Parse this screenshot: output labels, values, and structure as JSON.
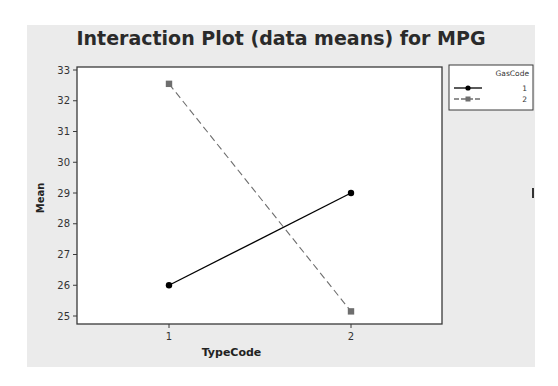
{
  "title": "Interaction Plot (data means) for MPG",
  "chart_data": {
    "type": "line",
    "title": "Interaction Plot (data means) for MPG",
    "xlabel": "TypeCode",
    "ylabel": "Mean",
    "categories": [
      "1",
      "2"
    ],
    "series": [
      {
        "name": "1",
        "legend_group": "GasCode",
        "marker": "circle",
        "line_style": "solid",
        "color": "#000000",
        "values": [
          26.0,
          29.0
        ]
      },
      {
        "name": "2",
        "legend_group": "GasCode",
        "marker": "square",
        "line_style": "dashed",
        "color": "#6e6e6e",
        "values": [
          32.55,
          25.15
        ]
      }
    ],
    "yticks": [
      25,
      26,
      27,
      28,
      29,
      30,
      31,
      32,
      33
    ],
    "ylim": [
      24.7,
      33.1
    ],
    "grid": false,
    "legend": {
      "title": "GasCode",
      "position": "right",
      "entries": [
        "1",
        "2"
      ]
    }
  },
  "axis": {
    "xlabel": "TypeCode",
    "ylabel": "Mean",
    "xticks": [
      "1",
      "2"
    ],
    "yticks": [
      "25",
      "26",
      "27",
      "28",
      "29",
      "30",
      "31",
      "32",
      "33"
    ]
  },
  "legend": {
    "title": "GasCode",
    "entries": [
      {
        "label": "1"
      },
      {
        "label": "2"
      }
    ]
  }
}
